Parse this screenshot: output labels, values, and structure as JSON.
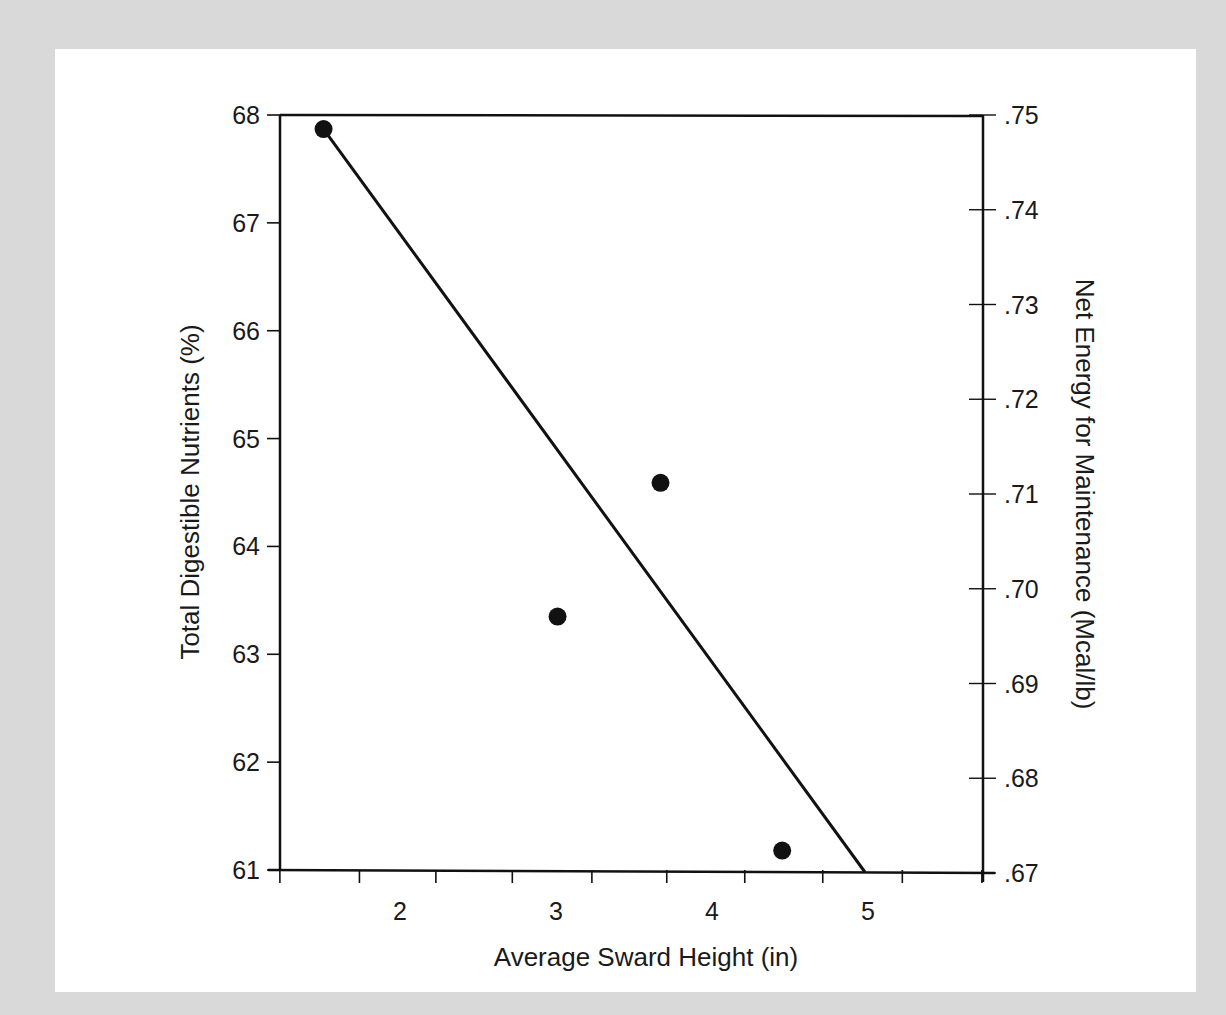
{
  "chart_data": {
    "type": "scatter",
    "title": "",
    "xlabel": "Average Sward Height (in)",
    "ylabel": "Total Digestible Nutrients (%)",
    "ylabel_right": "Net Energy for Maintenance (Mcal/lb)",
    "xlim": [
      1.23,
      5.73
    ],
    "ylim": [
      61,
      68
    ],
    "ylim_right": [
      0.67,
      0.75
    ],
    "x_tick_labels": [
      "2",
      "3",
      "4",
      "5"
    ],
    "x_tick_values": [
      2,
      3,
      4,
      5
    ],
    "x_minor_ticks": [
      1.23,
      1.74,
      2.23,
      2.72,
      3.23,
      3.71,
      4.21,
      4.71,
      5.22,
      5.73
    ],
    "y_tick_labels": [
      "68",
      "67",
      "66",
      "65",
      "64",
      "63",
      "62",
      "61"
    ],
    "y_tick_values": [
      68,
      67,
      66,
      65,
      64,
      63,
      62,
      61
    ],
    "y_right_tick_labels": [
      ".75",
      ".74",
      ".73",
      ".72",
      ".71",
      ".70",
      ".69",
      ".68",
      ".67"
    ],
    "y_right_tick_values": [
      0.75,
      0.74,
      0.73,
      0.72,
      0.71,
      0.7,
      0.69,
      0.68,
      0.67
    ],
    "grid": false,
    "legend": null,
    "series": [
      {
        "name": "Observed",
        "kind": "scatter",
        "x": [
          1.51,
          3.01,
          3.67,
          4.45
        ],
        "y": [
          67.87,
          63.35,
          64.59,
          61.18
        ]
      },
      {
        "name": "Regression line",
        "kind": "line",
        "x": [
          1.51,
          4.98
        ],
        "y": [
          67.87,
          61.0
        ]
      }
    ],
    "colors": {
      "ink": "#111111",
      "panel": "#ffffff",
      "background": "#d9d9d9"
    }
  }
}
